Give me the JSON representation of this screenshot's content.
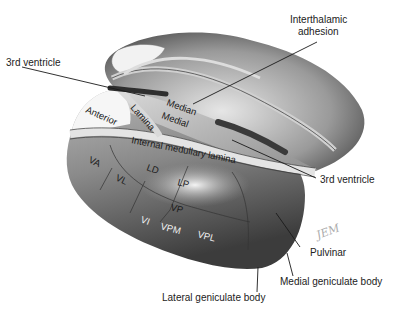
{
  "figure": {
    "external_labels": {
      "third_ventricle_left": "3rd ventricle",
      "interthalamic_adhesion_line1": "Interthalamic",
      "interthalamic_adhesion_line2": "adhesion",
      "third_ventricle_right": "3rd ventricle",
      "pulvinar": "Pulvinar",
      "medial_geniculate": "Medial geniculate body",
      "lateral_geniculate": "Lateral geniculate body"
    },
    "internal_labels": {
      "anterior": "Anterior",
      "lamina": "Lamina",
      "median": "Median",
      "medial": "Medial",
      "internal_medullary_lamina": "Internal medullary lamina",
      "va": "VA",
      "vl": "VL",
      "ld": "LD",
      "lp": "LP",
      "vp": "VP",
      "vi": "VI",
      "vpm": "VPM",
      "vpl": "VPL"
    },
    "signature": "JEM"
  }
}
